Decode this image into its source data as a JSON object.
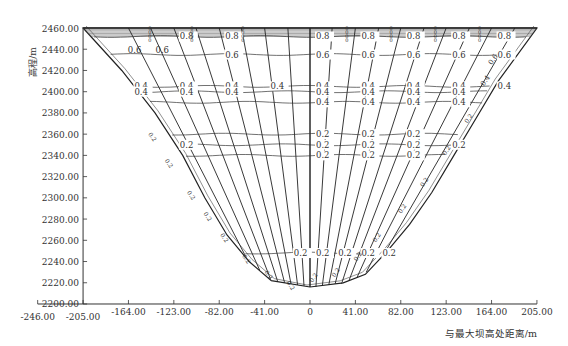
{
  "chart_data": {
    "type": "contour",
    "title": "",
    "xlabel": "与最大坝高处距离/m",
    "ylabel": "高程/m",
    "xlim": [
      -246,
      205
    ],
    "ylim": [
      2200,
      2460
    ],
    "x_ticks": [
      "-246.00",
      "-205.00",
      "-164.00",
      "-123.00",
      "-82.00",
      "-41.00",
      "0",
      "41.00",
      "82.00",
      "123.00",
      "164.00",
      "205.00"
    ],
    "y_ticks": [
      "2200.00",
      "2220.00",
      "2240.00",
      "2260.00",
      "2280.00",
      "2300.00",
      "2320.00",
      "2340.00",
      "2360.00",
      "2380.00",
      "2400.00",
      "2420.00",
      "2440.00",
      "2460.00"
    ],
    "grid": false,
    "legend": null,
    "contour_levels": [
      0.2,
      0.4,
      0.6,
      0.8,
      1.0
    ],
    "boundary": {
      "description": "V-shaped dam section boundary (crest at 2460, bottom at ~2215)",
      "points": [
        [
          -205,
          2460
        ],
        [
          -170,
          2420
        ],
        [
          -140,
          2380
        ],
        [
          -115,
          2340
        ],
        [
          -95,
          2300
        ],
        [
          -75,
          2265
        ],
        [
          -55,
          2240
        ],
        [
          -35,
          2222
        ],
        [
          0,
          2216
        ],
        [
          30,
          2220
        ],
        [
          50,
          2228
        ],
        [
          70,
          2250
        ],
        [
          90,
          2275
        ],
        [
          110,
          2305
        ],
        [
          130,
          2340
        ],
        [
          150,
          2375
        ],
        [
          170,
          2410
        ],
        [
          205,
          2460
        ]
      ]
    },
    "contours": [
      {
        "level": 0.8,
        "elevation_approx": 2452,
        "label_positions_x": [
          -123,
          -82,
          0,
          41,
          82,
          123,
          164
        ]
      },
      {
        "level": 0.6,
        "elevation_approx": 2435,
        "label_positions_x": [
          -82,
          0,
          41,
          82,
          123,
          164
        ]
      },
      {
        "level": 0.4,
        "elevation_approx": 2405,
        "label_positions_x": [
          -164,
          -123,
          -82,
          -41,
          0,
          41,
          82,
          123,
          164
        ]
      },
      {
        "level": 0.4,
        "elevation_approx": 2400,
        "label_positions_x": [
          -164,
          -123,
          -82,
          0,
          41,
          82,
          123
        ]
      },
      {
        "level": 0.4,
        "elevation_approx": 2390,
        "label_positions_x": [
          0,
          41,
          82,
          123
        ]
      },
      {
        "level": 0.2,
        "elevation_approx": 2360,
        "label_positions_x": [
          0,
          41,
          82
        ]
      },
      {
        "level": 0.2,
        "elevation_approx": 2350,
        "label_positions_x": [
          -123,
          0,
          41,
          82,
          123
        ]
      },
      {
        "level": 0.2,
        "elevation_approx": 2340,
        "label_positions_x": [
          0,
          41,
          82
        ]
      },
      {
        "level": 0.2,
        "elevation_approx": 2248,
        "label_positions_x": [
          -20,
          0,
          20,
          41,
          60
        ]
      }
    ]
  },
  "labels": {
    "ylabel": "高程/m",
    "xlabel": "与最大坝高处距离/m"
  }
}
